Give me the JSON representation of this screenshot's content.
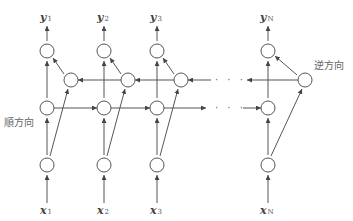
{
  "diagram": {
    "type": "bidirectional-rnn",
    "labels": {
      "forward_direction": "順方向",
      "backward_direction": "逆方向",
      "ellipsis": "· · ·"
    },
    "columns": [
      {
        "output_var": "y",
        "output_sub": "1",
        "input_var": "x",
        "input_sub": "1"
      },
      {
        "output_var": "y",
        "output_sub": "2",
        "input_var": "x",
        "input_sub": "2"
      },
      {
        "output_var": "y",
        "output_sub": "3",
        "input_var": "x",
        "input_sub": "3"
      },
      {
        "output_var": "y",
        "output_sub": "N",
        "input_var": "x",
        "input_sub": "N"
      }
    ],
    "colors": {
      "stroke": "#555555",
      "text": "#444444"
    }
  }
}
